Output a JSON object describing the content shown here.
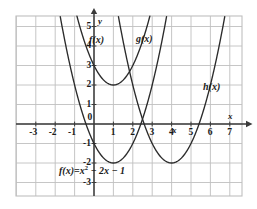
{
  "figure": {
    "equation_label": "f(x) = x² − 2x − 1",
    "equation_parts": {
      "lhs": "f(x)",
      "eq": "=",
      "rhs_base": "x",
      "rhs_exp": "2",
      "rhs_tail": " − 2x − 1"
    },
    "colors": {
      "curve": "#2b2b2b",
      "axis": "#3a3a3a",
      "grid": "#bfbfbf",
      "background": "#ffffff"
    }
  },
  "chart_data": {
    "type": "line",
    "title": "",
    "subtitle": "",
    "xlabel": "x",
    "ylabel": "y",
    "xlim": [
      -4,
      7.6
    ],
    "ylim": [
      -3.5,
      5.8
    ],
    "xticks": [
      -3,
      -2,
      -1,
      0,
      1,
      2,
      3,
      4,
      5,
      6,
      7
    ],
    "yticks": [
      -3,
      -2,
      -1,
      0,
      1,
      2,
      3,
      4,
      5
    ],
    "xtick_labels": [
      "-3",
      "-2",
      "-1",
      "0",
      "1",
      "2",
      "3",
      "4",
      "5",
      "6",
      "7"
    ],
    "ytick_labels": [
      "-3",
      "-2",
      "-1",
      "0",
      "1",
      "2",
      "3",
      "4",
      "5"
    ],
    "grid": true,
    "grid_spacing": 1,
    "legend": "inline-annotations",
    "series": [
      {
        "name": "f(x)",
        "label": "f(x)",
        "equation": "f(x) = x^2 - 2x - 1",
        "coefficients": {
          "a": 1,
          "b": -2,
          "c": -1
        },
        "vertex": [
          1,
          -2
        ],
        "roots": [
          -0.4142,
          2.4142
        ],
        "y_intercept": -1,
        "label_position": [
          0.0,
          4.4
        ],
        "points": [
          [
            -1.0,
            2.0
          ],
          [
            -0.5,
            0.25
          ],
          [
            0.0,
            -1.0
          ],
          [
            0.5,
            -1.75
          ],
          [
            1.0,
            -2.0
          ],
          [
            1.5,
            -1.75
          ],
          [
            2.0,
            -1.0
          ],
          [
            2.5,
            0.25
          ],
          [
            3.0,
            2.0
          ]
        ]
      },
      {
        "name": "g(x)",
        "label": "g(x)",
        "equation": "g(x) = x^2 - 2x + 3",
        "coefficients": {
          "a": 1,
          "b": -2,
          "c": 3
        },
        "vertex": [
          1,
          2
        ],
        "roots": [],
        "y_intercept": 3,
        "label_position": [
          2.4,
          4.4
        ],
        "points": [
          [
            -0.7,
            4.89
          ],
          [
            -0.5,
            4.25
          ],
          [
            0.0,
            3.0
          ],
          [
            0.5,
            2.25
          ],
          [
            1.0,
            2.0
          ],
          [
            1.5,
            2.25
          ],
          [
            2.0,
            3.0
          ],
          [
            2.5,
            4.25
          ],
          [
            2.7,
            4.89
          ]
        ]
      },
      {
        "name": "h(x)",
        "label": "h(x)",
        "equation": "h(x) = x^2 - 8x + 14",
        "coefficients": {
          "a": 1,
          "b": -8,
          "c": 14
        },
        "vertex": [
          4,
          -2
        ],
        "roots": [
          2.5858,
          5.4142
        ],
        "y_intercept": 14,
        "label_position": [
          5.7,
          1.35
        ],
        "points": [
          [
            2.0,
            -2.0
          ],
          [
            2.5,
            -0.25
          ],
          [
            3.0,
            -1.0
          ],
          [
            3.5,
            -1.75
          ],
          [
            4.0,
            -2.0
          ],
          [
            4.5,
            -1.75
          ],
          [
            5.0,
            -1.0
          ],
          [
            5.5,
            0.25
          ],
          [
            6.0,
            2.0
          ]
        ]
      }
    ],
    "annotations": [
      {
        "text": "f(x)",
        "x": 0.0,
        "y": 4.4
      },
      {
        "text": "g(x)",
        "x": 2.4,
        "y": 4.4
      },
      {
        "text": "h(x)",
        "x": 5.7,
        "y": 1.35
      },
      {
        "text": "f(x) = x² − 2x − 1",
        "x": 0.6,
        "y": -2.6
      }
    ]
  },
  "axes": {
    "x_axis_name": "x",
    "y_axis_name": "y",
    "x_arrow": "right-arrow",
    "y_arrow": "up-arrow"
  }
}
